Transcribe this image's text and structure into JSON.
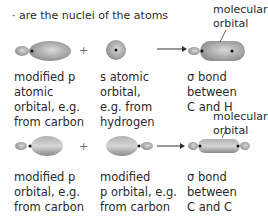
{
  "legend": {
    "text": "· are the nuclei of the atoms"
  },
  "rows": [
    {
      "reactant1": "modified p\natomic\norbital, e.g.\nfrom carbon",
      "operator": "+",
      "reactant2": "s atomic\norbital,\ne.g. from\nhydrogen",
      "product": "σ bond\nbetween\nC and H",
      "product_annotation": "molecular\norbital"
    },
    {
      "reactant1": "modified p\norbital, e.g.\nfrom carbon",
      "operator": "+",
      "reactant2": "modified\np orbital, e.g.\nfrom carbon",
      "product": "σ bond\nbetween\nC and C",
      "product_annotation": "molecular\norbital"
    }
  ],
  "colors": {
    "orbital_fill": "#9a9a9a",
    "orbital_light": "#d8d8d8",
    "text": "#2a2a2a"
  }
}
